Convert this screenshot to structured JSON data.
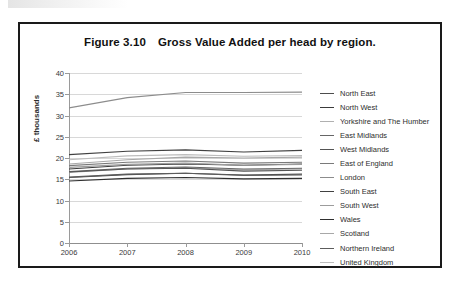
{
  "figure": {
    "number": "Figure 3.10",
    "title": "Gross Value Added per head by region."
  },
  "chart_data": {
    "type": "line",
    "title": "Gross Value Added per head by region.",
    "xlabel": "",
    "ylabel": "£ thousands",
    "x": [
      "2006",
      "2007",
      "2008",
      "2009",
      "2010"
    ],
    "categories": [
      "2006",
      "2007",
      "2008",
      "2009",
      "2010"
    ],
    "ylim": [
      0,
      40
    ],
    "yticks": [
      0,
      5,
      10,
      15,
      20,
      25,
      30,
      35,
      40
    ],
    "grid": true,
    "legend_position": "right",
    "series": [
      {
        "name": "North East",
        "color": "#4d4d4d",
        "values": [
          15.4,
          16.1,
          16.4,
          16.0,
          16.2
        ]
      },
      {
        "name": "North West",
        "color": "#3a3a3a",
        "values": [
          17.4,
          18.3,
          18.6,
          18.3,
          18.6
        ]
      },
      {
        "name": "Yorkshire and The Humber",
        "color": "#b0b0b0",
        "values": [
          16.6,
          17.4,
          17.7,
          17.2,
          17.4
        ]
      },
      {
        "name": "East Midlands",
        "color": "#666666",
        "values": [
          16.8,
          17.6,
          17.9,
          17.4,
          17.6
        ]
      },
      {
        "name": "West Midlands",
        "color": "#545454",
        "values": [
          16.7,
          17.4,
          17.6,
          16.9,
          17.1
        ]
      },
      {
        "name": "East of England",
        "color": "#7a7a7a",
        "values": [
          18.2,
          19.0,
          19.3,
          18.8,
          19.0
        ]
      },
      {
        "name": "London",
        "color": "#8c8c8c",
        "values": [
          31.8,
          34.2,
          35.4,
          35.4,
          35.5
        ]
      },
      {
        "name": "South East",
        "color": "#414141",
        "values": [
          20.8,
          21.6,
          21.9,
          21.4,
          21.8
        ]
      },
      {
        "name": "South West",
        "color": "#9c9c9c",
        "values": [
          17.8,
          18.5,
          18.8,
          18.3,
          18.5
        ]
      },
      {
        "name": "Wales",
        "color": "#2f2f2f",
        "values": [
          14.6,
          15.2,
          15.4,
          15.1,
          15.2
        ]
      },
      {
        "name": "Scotland",
        "color": "#a8a8a8",
        "values": [
          18.6,
          19.6,
          20.2,
          20.0,
          20.2
        ]
      },
      {
        "name": "Northern Ireland",
        "color": "#5c5c5c",
        "values": [
          15.5,
          16.2,
          16.4,
          15.9,
          16.0
        ]
      },
      {
        "name": "United Kingdom",
        "color": "#bdbdbd",
        "values": [
          19.6,
          20.5,
          20.8,
          20.4,
          20.6
        ]
      }
    ]
  }
}
